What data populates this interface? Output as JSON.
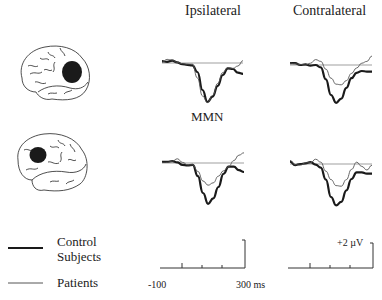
{
  "headers": {
    "ipsilateral": "Ipsilateral",
    "contralateral": "Contralateral"
  },
  "component_label": "MMN",
  "legend": {
    "control_line1": "Control",
    "control_line2": "Subjects",
    "patients": "Patients"
  },
  "scale": {
    "time_start": "-100",
    "time_end": "300 ms",
    "amplitude": "+2 µV"
  },
  "rows": [
    {
      "lesion_site": "temporo-parietal (posterior)",
      "icon": "brain-lesion-posterior-icon"
    },
    {
      "lesion_site": "frontal (anterior)",
      "icon": "brain-lesion-frontal-icon"
    }
  ],
  "colors": {
    "control": "#1a1a1a",
    "patients": "#555555",
    "baseline": "#777777",
    "lesion": "#1a1a1a"
  },
  "chart_data": {
    "type": "line",
    "title": "",
    "xlabel": "Time (ms)",
    "ylabel": "Amplitude (µV)",
    "xlim": [
      -100,
      300
    ],
    "x": [
      -100,
      -75,
      -50,
      -25,
      0,
      25,
      50,
      75,
      100,
      125,
      150,
      175,
      200,
      225,
      250,
      275,
      300
    ],
    "panels": [
      {
        "row": 1,
        "column": "Ipsilateral",
        "series": [
          {
            "name": "Control Subjects",
            "values": [
              0.3,
              0.2,
              0.4,
              0.1,
              -0.2,
              -0.3,
              -0.4,
              -1.5,
              -4.5,
              -6.5,
              -5.6,
              -3.8,
              -2.0,
              -0.9,
              -1.0,
              -1.6,
              -1.8
            ]
          },
          {
            "name": "Patients",
            "values": [
              0.1,
              0.6,
              0.5,
              0.1,
              -0.1,
              -0.2,
              -0.2,
              -2.5,
              -5.5,
              -6.6,
              -5.4,
              -3.4,
              -1.6,
              -0.8,
              -0.9,
              -0.5,
              0.4
            ]
          }
        ]
      },
      {
        "row": 1,
        "column": "Contralateral",
        "series": [
          {
            "name": "Control Subjects",
            "values": [
              0.3,
              0.3,
              0.0,
              0.1,
              -0.1,
              0.0,
              -0.4,
              -2.4,
              -5.0,
              -6.3,
              -5.6,
              -3.8,
              -2.2,
              -1.3,
              -1.0,
              -1.1,
              -1.1
            ]
          },
          {
            "name": "Patients",
            "values": [
              0.3,
              0.2,
              0.1,
              0.0,
              0.3,
              0.9,
              0.6,
              -0.7,
              -2.2,
              -3.2,
              -3.3,
              -2.6,
              -1.4,
              -0.5,
              0.3,
              0.6,
              1.5
            ]
          }
        ]
      },
      {
        "row": 2,
        "column": "Ipsilateral",
        "series": [
          {
            "name": "Control Subjects",
            "values": [
              0.2,
              0.2,
              0.3,
              0.1,
              -0.3,
              -0.4,
              -0.3,
              -2.2,
              -5.0,
              -6.8,
              -5.9,
              -4.0,
              -1.8,
              -0.6,
              -0.6,
              -1.2,
              -1.5
            ]
          },
          {
            "name": "Patients",
            "values": [
              0.1,
              0.1,
              0.3,
              0.7,
              0.1,
              -0.3,
              -0.3,
              -1.4,
              -3.0,
              -3.7,
              -3.3,
              -2.2,
              -1.3,
              -0.6,
              0.4,
              1.3,
              1.7
            ]
          }
        ]
      },
      {
        "row": 2,
        "column": "Contralateral",
        "series": [
          {
            "name": "Control Subjects",
            "values": [
              0.4,
              -0.2,
              0.0,
              0.1,
              0.3,
              -0.1,
              -0.6,
              -2.6,
              -5.5,
              -6.9,
              -6.3,
              -4.4,
              -2.5,
              -1.4,
              -1.4,
              -1.6,
              -1.6
            ]
          },
          {
            "name": "Patients",
            "values": [
              0.6,
              -0.1,
              -0.2,
              0.2,
              0.2,
              0.8,
              0.3,
              -1.2,
              -2.6,
              -3.6,
              -3.7,
              -2.6,
              -0.9,
              0.3,
              -0.4,
              -1.0,
              -0.2
            ]
          }
        ]
      }
    ],
    "legend": [
      "Control Subjects (thick)",
      "Patients (thin)"
    ],
    "annotations": [
      "MMN",
      "+2 µV",
      "-100",
      "300 ms"
    ],
    "grid": false
  }
}
